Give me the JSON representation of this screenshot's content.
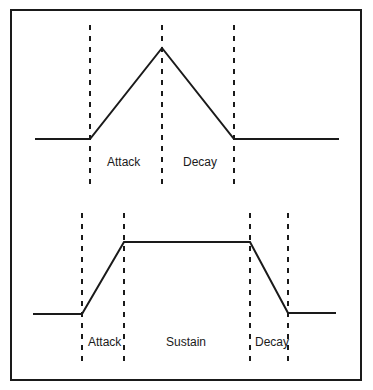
{
  "colors": {
    "line": "#1a1a1a",
    "background": "#ffffff"
  },
  "top_panel": {
    "name": "Attack-Decay envelope",
    "labels": {
      "attack": "Attack",
      "decay": "Decay"
    }
  },
  "bottom_panel": {
    "name": "Attack-Sustain-Decay envelope",
    "labels": {
      "attack": "Attack",
      "sustain": "Sustain",
      "decay": "Decay"
    }
  }
}
